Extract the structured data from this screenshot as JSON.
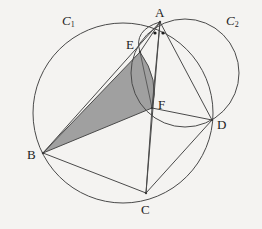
{
  "figure": {
    "kind": "euclidean-geometry-diagram",
    "width": 262,
    "height": 229,
    "background_color": "#f4f3f1",
    "stroke_color": "#4a4a4a",
    "shade_color": "#9b9b9b",
    "label_color": "#1d1d1d"
  },
  "circles": [
    {
      "name": "C1",
      "label": "C",
      "subscript": "1",
      "label_x": 62,
      "label_y": 14,
      "cx": 123,
      "cy": 113,
      "r": 90,
      "passes_through": [
        "A",
        "B",
        "C",
        "D"
      ]
    },
    {
      "name": "C2",
      "label": "C",
      "subscript": "2",
      "label_x": 226,
      "label_y": 14,
      "cx": 185,
      "cy": 73,
      "r": 54,
      "passes_through": [
        "A",
        "F",
        "D"
      ]
    }
  ],
  "points": [
    {
      "id": "A",
      "label": "A",
      "x": 160,
      "y": 22,
      "label_x": 155,
      "label_y": 6
    },
    {
      "id": "B",
      "label": "B",
      "x": 43,
      "y": 153,
      "label_x": 27,
      "label_y": 148
    },
    {
      "id": "C",
      "label": "C",
      "x": 146,
      "y": 193,
      "label_x": 141,
      "label_y": 203
    },
    {
      "id": "D",
      "label": "D",
      "x": 212,
      "y": 120,
      "label_x": 217,
      "label_y": 118
    },
    {
      "id": "E",
      "label": "E",
      "x": 140,
      "y": 52,
      "label_x": 126,
      "label_y": 38
    },
    {
      "id": "F",
      "label": "F",
      "x": 152,
      "y": 108,
      "label_x": 158,
      "label_y": 98
    }
  ],
  "segments": [
    {
      "from": "A",
      "to": "B"
    },
    {
      "from": "A",
      "to": "C"
    },
    {
      "from": "A",
      "to": "D"
    },
    {
      "from": "A",
      "to": "F"
    },
    {
      "from": "B",
      "to": "C"
    },
    {
      "from": "B",
      "to": "F"
    },
    {
      "from": "B",
      "to": "E"
    },
    {
      "from": "E",
      "to": "F"
    },
    {
      "from": "C",
      "to": "D"
    },
    {
      "from": "C",
      "to": "F"
    },
    {
      "from": "F",
      "to": "D"
    }
  ],
  "arcs": [
    {
      "name": "arc-A-E-F",
      "from": "A",
      "through": "E",
      "to": "F",
      "note": "arc of circle through A, E, F bulging right"
    }
  ],
  "shaded_region": {
    "name": "region-BEF",
    "vertices": [
      "B",
      "E",
      "F"
    ],
    "curved_edge": "E-F",
    "fill": "#9b9b9b",
    "opacity": 0.95
  },
  "angle_marks": {
    "name": "equal-angle-dots-at-A",
    "count": 2,
    "vertex": "A",
    "dots": [
      {
        "x": 155,
        "y": 33
      },
      {
        "x": 163,
        "y": 33
      }
    ],
    "radius": 1.6
  }
}
